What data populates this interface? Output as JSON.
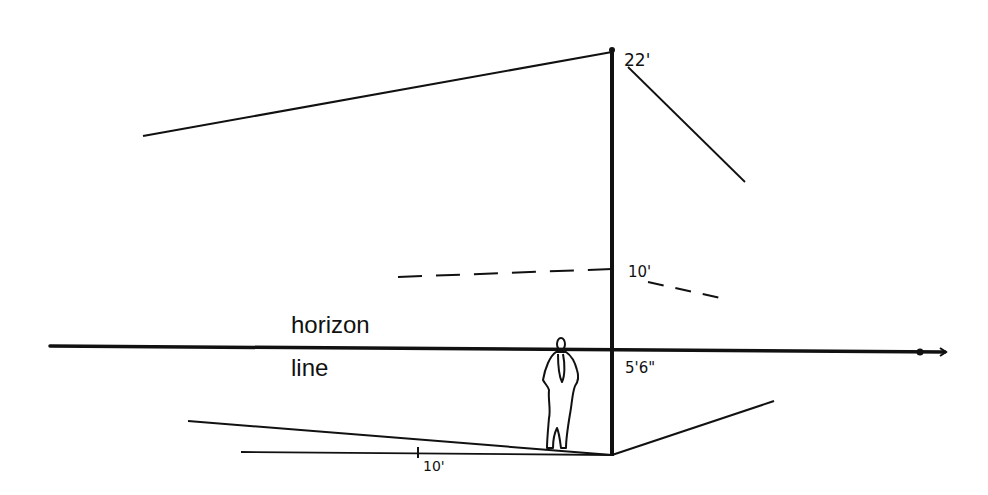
{
  "diagram": {
    "labels": {
      "horizon_top": "horizon",
      "horizon_bottom": "line",
      "height_22": "22'",
      "height_10": "10'",
      "eye_level": "5'6\"",
      "ground_measure": "10'"
    },
    "colors": {
      "ink": "#111111",
      "background": "#ffffff"
    }
  }
}
